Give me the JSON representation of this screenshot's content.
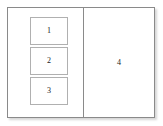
{
  "diagram": {
    "type": "layout-wireframe",
    "background_color": "#ffffff",
    "frame": {
      "border_color": "#8a8a8a",
      "fill_color": "#ffffff",
      "has_drop_shadow": true
    },
    "divider": {
      "orientation": "vertical",
      "color": "#8a8a8a"
    },
    "left_pane": {
      "regions": [
        {
          "label": "1",
          "border_color": "#b0b0b0",
          "fill_color": "#ffffff"
        },
        {
          "label": "2",
          "border_color": "#b0b0b0",
          "fill_color": "#ffffff"
        },
        {
          "label": "3",
          "border_color": "#b0b0b0",
          "fill_color": "#ffffff"
        }
      ]
    },
    "right_pane": {
      "label": "4"
    }
  }
}
